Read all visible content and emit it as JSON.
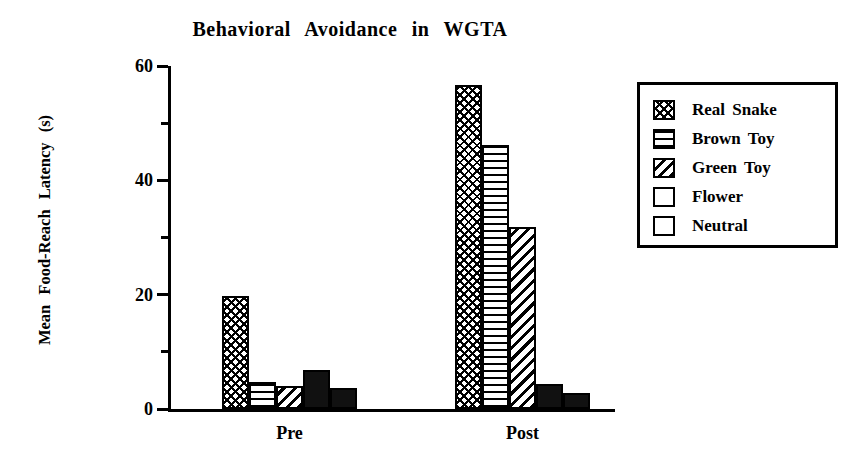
{
  "chart_data": {
    "type": "bar",
    "title": "Behavioral  Avoidance  in  WGTA",
    "xlabel": "",
    "ylabel": "Mean  Food-Reach  Latency  (s)",
    "categories": [
      "Pre",
      "Post"
    ],
    "series": [
      {
        "name": "Real Snake",
        "values": [
          19.8,
          56.6
        ],
        "pattern": "crosshatch"
      },
      {
        "name": "Brown Toy",
        "values": [
          4.8,
          46.2
        ],
        "pattern": "horizontal"
      },
      {
        "name": "Green Toy",
        "values": [
          4.1,
          31.8
        ],
        "pattern": "diagonal"
      },
      {
        "name": "Flower",
        "values": [
          6.9,
          4.3
        ],
        "pattern": "solid"
      },
      {
        "name": "Neutral",
        "values": [
          3.7,
          2.8
        ],
        "pattern": "solid"
      }
    ],
    "ylim": [
      0,
      60
    ],
    "yticks_major": [
      0,
      20,
      40,
      60
    ],
    "yticks_minor": [
      10,
      30,
      50
    ],
    "ytick_labels": [
      "0",
      "20",
      "40",
      "60"
    ],
    "grid": false,
    "legend_position": "right",
    "colors": {
      "ink": "#000000",
      "background": "#ffffff",
      "fill": "#111111"
    }
  },
  "legend": {
    "entries": [
      {
        "label": "Real Snake"
      },
      {
        "label": "Brown Toy"
      },
      {
        "label": "Green Toy"
      },
      {
        "label": "Flower"
      },
      {
        "label": "Neutral"
      }
    ]
  }
}
